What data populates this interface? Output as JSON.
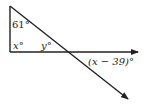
{
  "diagram": {
    "labels": {
      "top_angle": "61°",
      "right_angle": "x°",
      "inner_angle": "y°",
      "exterior_angle": "(x − 39)°"
    },
    "colors": {
      "line": "#222222",
      "background": "#ffffff"
    }
  }
}
